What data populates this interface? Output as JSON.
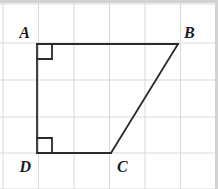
{
  "figure": {
    "canvas": {
      "width": 218,
      "height": 189
    },
    "colors": {
      "background": "#ffffff",
      "grid_line": "#d9d9d9",
      "shape_stroke": "#2b2b2b",
      "label_text": "#1a1a1a",
      "border_strip": "#d2d2d2",
      "outer_edge": "#bdbdbd"
    },
    "grid": {
      "visible": true,
      "x_lines": [
        3,
        38.5,
        74,
        109.5,
        145,
        180.5,
        216
      ],
      "y_lines": [
        4,
        43,
        80,
        117,
        153,
        189
      ],
      "cell_width": 35.5,
      "cell_height": 36.8,
      "stroke_width": 1
    },
    "border_strips": {
      "top": {
        "x": 0,
        "y": 0,
        "width": 218,
        "height": 3
      },
      "right": {
        "x": 215,
        "y": 0,
        "width": 3,
        "height": 189
      }
    },
    "vertices": [
      {
        "id": "A",
        "label": "A",
        "x": 37,
        "y": 44,
        "label_x": 30,
        "label_y": 38,
        "label_anchor": "end"
      },
      {
        "id": "B",
        "label": "B",
        "x": 178,
        "y": 44,
        "label_x": 184,
        "label_y": 38,
        "label_anchor": "start"
      },
      {
        "id": "C",
        "label": "C",
        "x": 111,
        "y": 153,
        "label_x": 117,
        "label_y": 172,
        "label_anchor": "start"
      },
      {
        "id": "D",
        "label": "D",
        "x": 37,
        "y": 153,
        "label_x": 31,
        "label_y": 172,
        "label_anchor": "end"
      }
    ],
    "edges": [
      {
        "id": "AB",
        "from": "A",
        "to": "B",
        "x1": 37,
        "y1": 44,
        "x2": 178,
        "y2": 44
      },
      {
        "id": "BC",
        "from": "B",
        "to": "C",
        "x1": 178,
        "y1": 44,
        "x2": 111,
        "y2": 153
      },
      {
        "id": "CD",
        "from": "C",
        "to": "D",
        "x1": 111,
        "y1": 153,
        "x2": 37,
        "y2": 153
      },
      {
        "id": "DA",
        "from": "D",
        "to": "A",
        "x1": 37,
        "y1": 153,
        "x2": 37,
        "y2": 44
      }
    ],
    "shape_stroke_width": 1.8,
    "right_angle_marks": [
      {
        "id": "angle-A",
        "at": "A",
        "points": "37,59 52,59 52,44",
        "size": 15
      },
      {
        "id": "angle-D",
        "at": "D",
        "points": "37,138 52,138 52,153",
        "size": 15
      }
    ]
  }
}
